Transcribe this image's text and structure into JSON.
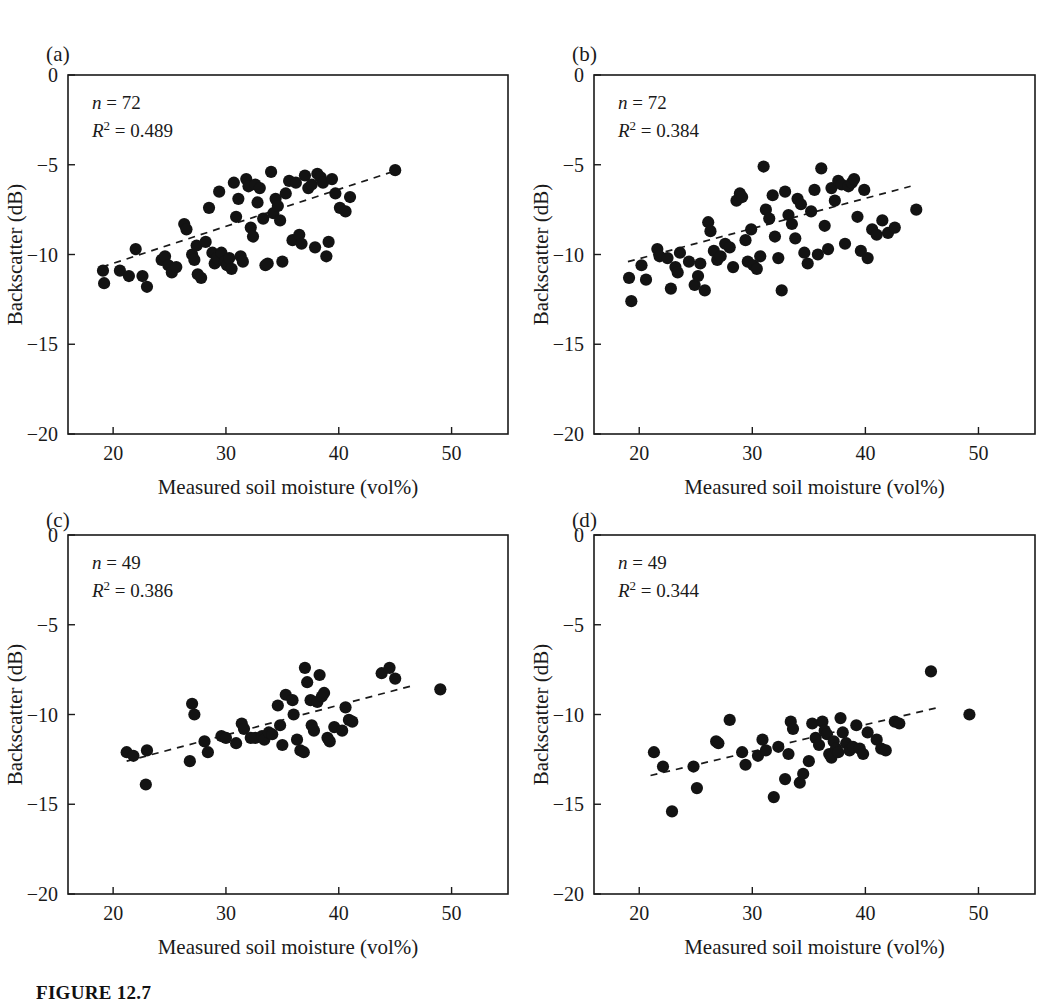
{
  "figure": {
    "caption": "FIGURE 12.7",
    "axis": {
      "xlabel": "Measured soil moisture (vol%)",
      "ylabel": "Backscatter (dB)",
      "xticks": [
        "20",
        "30",
        "40",
        "50"
      ],
      "yticks": [
        "0",
        "-5",
        "-10",
        "-15",
        "-20"
      ]
    }
  },
  "chart_data": [
    {
      "type": "scatter",
      "panel": "(a)",
      "title": "",
      "xlabel": "Measured soil moisture (vol%)",
      "ylabel": "Backscatter (dB)",
      "xlim": [
        16,
        55
      ],
      "ylim": [
        -20,
        0
      ],
      "xticks": [
        20,
        30,
        40,
        50
      ],
      "yticks": [
        0,
        -5,
        -10,
        -15,
        -20
      ],
      "grid": false,
      "legend": false,
      "annotations": {
        "n": "n = 72",
        "r2": "R2 = 0.489",
        "n_value": 72,
        "r2_value": 0.489
      },
      "trendline": {
        "style": "dashed",
        "x": [
          19.0,
          45.2
        ],
        "y": [
          -10.7,
          -5.3
        ]
      },
      "points": [
        [
          19.1,
          -10.9
        ],
        [
          19.2,
          -11.6
        ],
        [
          20.6,
          -10.9
        ],
        [
          21.4,
          -11.2
        ],
        [
          22.0,
          -9.7
        ],
        [
          22.6,
          -11.2
        ],
        [
          23.0,
          -11.8
        ],
        [
          24.3,
          -10.3
        ],
        [
          24.6,
          -10.1
        ],
        [
          24.9,
          -10.6
        ],
        [
          25.2,
          -11.0
        ],
        [
          25.6,
          -10.7
        ],
        [
          26.3,
          -8.3
        ],
        [
          26.5,
          -8.6
        ],
        [
          27.0,
          -10.0
        ],
        [
          27.2,
          -10.3
        ],
        [
          27.4,
          -9.5
        ],
        [
          27.5,
          -11.1
        ],
        [
          27.8,
          -11.3
        ],
        [
          28.2,
          -9.3
        ],
        [
          28.5,
          -7.4
        ],
        [
          28.8,
          -9.9
        ],
        [
          29.0,
          -10.5
        ],
        [
          29.2,
          -10.2
        ],
        [
          29.4,
          -6.5
        ],
        [
          29.6,
          -9.9
        ],
        [
          29.9,
          -10.4
        ],
        [
          30.1,
          -10.6
        ],
        [
          30.3,
          -10.2
        ],
        [
          30.5,
          -10.8
        ],
        [
          30.7,
          -6.0
        ],
        [
          30.9,
          -7.9
        ],
        [
          31.1,
          -6.9
        ],
        [
          31.3,
          -10.1
        ],
        [
          31.5,
          -10.4
        ],
        [
          31.8,
          -5.8
        ],
        [
          32.0,
          -6.2
        ],
        [
          32.2,
          -8.5
        ],
        [
          32.4,
          -9.0
        ],
        [
          32.6,
          -6.1
        ],
        [
          32.8,
          -7.1
        ],
        [
          33.0,
          -6.3
        ],
        [
          33.3,
          -8.0
        ],
        [
          33.5,
          -10.6
        ],
        [
          33.7,
          -10.5
        ],
        [
          34.0,
          -5.4
        ],
        [
          34.2,
          -7.7
        ],
        [
          34.4,
          -6.9
        ],
        [
          34.6,
          -7.3
        ],
        [
          34.8,
          -8.1
        ],
        [
          35.0,
          -10.4
        ],
        [
          35.3,
          -6.6
        ],
        [
          35.6,
          -5.9
        ],
        [
          35.9,
          -9.2
        ],
        [
          36.2,
          -6.0
        ],
        [
          36.5,
          -8.9
        ],
        [
          36.7,
          -9.4
        ],
        [
          37.0,
          -5.6
        ],
        [
          37.3,
          -6.3
        ],
        [
          37.6,
          -6.1
        ],
        [
          37.9,
          -9.6
        ],
        [
          38.1,
          -5.5
        ],
        [
          38.4,
          -5.7
        ],
        [
          38.6,
          -6.0
        ],
        [
          38.9,
          -10.1
        ],
        [
          39.1,
          -9.3
        ],
        [
          39.4,
          -5.8
        ],
        [
          39.7,
          -6.6
        ],
        [
          40.1,
          -7.4
        ],
        [
          40.6,
          -7.6
        ],
        [
          41.0,
          -6.8
        ],
        [
          45.0,
          -5.3
        ]
      ]
    },
    {
      "type": "scatter",
      "panel": "(b)",
      "title": "",
      "xlabel": "Measured soil moisture (vol%)",
      "ylabel": "Backscatter (dB)",
      "xlim": [
        16,
        55
      ],
      "ylim": [
        -20,
        0
      ],
      "xticks": [
        20,
        30,
        40,
        50
      ],
      "yticks": [
        0,
        -5,
        -10,
        -15,
        -20
      ],
      "grid": false,
      "legend": false,
      "annotations": {
        "n": "n = 72",
        "r2": "R2 = 0.384",
        "n_value": 72,
        "r2_value": 0.384
      },
      "trendline": {
        "style": "dashed",
        "x": [
          19.0,
          44.0
        ],
        "y": [
          -10.4,
          -6.2
        ]
      },
      "points": [
        [
          19.1,
          -11.3
        ],
        [
          19.3,
          -12.6
        ],
        [
          20.2,
          -10.6
        ],
        [
          20.6,
          -11.4
        ],
        [
          21.6,
          -9.7
        ],
        [
          21.8,
          -10.1
        ],
        [
          22.5,
          -10.2
        ],
        [
          22.8,
          -11.9
        ],
        [
          23.2,
          -10.7
        ],
        [
          23.4,
          -11.0
        ],
        [
          23.6,
          -9.9
        ],
        [
          24.4,
          -10.4
        ],
        [
          24.9,
          -11.7
        ],
        [
          25.2,
          -11.2
        ],
        [
          25.4,
          -10.5
        ],
        [
          25.8,
          -12.0
        ],
        [
          26.1,
          -8.2
        ],
        [
          26.3,
          -8.7
        ],
        [
          26.6,
          -9.8
        ],
        [
          26.9,
          -10.3
        ],
        [
          27.2,
          -10.1
        ],
        [
          27.6,
          -9.4
        ],
        [
          28.0,
          -9.6
        ],
        [
          28.3,
          -10.7
        ],
        [
          28.6,
          -7.0
        ],
        [
          28.9,
          -6.6
        ],
        [
          29.1,
          -6.8
        ],
        [
          29.4,
          -9.2
        ],
        [
          29.6,
          -10.4
        ],
        [
          29.9,
          -8.6
        ],
        [
          30.1,
          -10.6
        ],
        [
          30.4,
          -10.8
        ],
        [
          30.7,
          -10.1
        ],
        [
          31.0,
          -5.1
        ],
        [
          31.2,
          -7.5
        ],
        [
          31.5,
          -8.0
        ],
        [
          31.8,
          -6.7
        ],
        [
          32.0,
          -9.0
        ],
        [
          32.3,
          -10.2
        ],
        [
          32.6,
          -12.0
        ],
        [
          32.9,
          -6.5
        ],
        [
          33.2,
          -7.8
        ],
        [
          33.5,
          -8.3
        ],
        [
          33.8,
          -9.1
        ],
        [
          34.0,
          -6.9
        ],
        [
          34.3,
          -7.2
        ],
        [
          34.6,
          -9.9
        ],
        [
          34.9,
          -10.5
        ],
        [
          35.2,
          -7.6
        ],
        [
          35.5,
          -6.4
        ],
        [
          35.8,
          -10.0
        ],
        [
          36.1,
          -5.2
        ],
        [
          36.4,
          -8.4
        ],
        [
          36.7,
          -9.7
        ],
        [
          37.0,
          -6.3
        ],
        [
          37.3,
          -7.0
        ],
        [
          37.6,
          -5.9
        ],
        [
          37.9,
          -6.1
        ],
        [
          38.2,
          -9.4
        ],
        [
          38.5,
          -6.2
        ],
        [
          38.8,
          -6.0
        ],
        [
          39.0,
          -5.8
        ],
        [
          39.3,
          -7.9
        ],
        [
          39.6,
          -9.8
        ],
        [
          39.9,
          -6.4
        ],
        [
          40.2,
          -10.2
        ],
        [
          40.6,
          -8.6
        ],
        [
          41.0,
          -8.9
        ],
        [
          41.5,
          -8.1
        ],
        [
          42.0,
          -8.8
        ],
        [
          42.6,
          -8.5
        ],
        [
          44.5,
          -7.5
        ]
      ]
    },
    {
      "type": "scatter",
      "panel": "(c)",
      "title": "",
      "xlabel": "Measured soil moisture (vol%)",
      "ylabel": "Backscatter (dB)",
      "xlim": [
        16,
        55
      ],
      "ylim": [
        -20,
        0
      ],
      "xticks": [
        20,
        30,
        40,
        50
      ],
      "yticks": [
        0,
        -5,
        -10,
        -15,
        -20
      ],
      "grid": false,
      "legend": false,
      "annotations": {
        "n": "n = 49",
        "r2": "R2 = 0.386",
        "n_value": 49,
        "r2_value": 0.386
      },
      "trendline": {
        "style": "dashed",
        "x": [
          21.2,
          46.5
        ],
        "y": [
          -12.6,
          -8.4
        ]
      },
      "points": [
        [
          21.2,
          -12.1
        ],
        [
          21.8,
          -12.3
        ],
        [
          22.9,
          -13.9
        ],
        [
          23.0,
          -12.0
        ],
        [
          26.8,
          -12.6
        ],
        [
          27.0,
          -9.4
        ],
        [
          27.2,
          -10.0
        ],
        [
          28.1,
          -11.5
        ],
        [
          28.4,
          -12.1
        ],
        [
          29.6,
          -11.2
        ],
        [
          30.0,
          -11.3
        ],
        [
          30.9,
          -11.6
        ],
        [
          31.4,
          -10.5
        ],
        [
          31.6,
          -10.8
        ],
        [
          32.2,
          -11.3
        ],
        [
          32.6,
          -11.3
        ],
        [
          33.2,
          -11.2
        ],
        [
          33.4,
          -11.4
        ],
        [
          33.8,
          -11.0
        ],
        [
          34.1,
          -11.1
        ],
        [
          34.6,
          -9.5
        ],
        [
          34.8,
          -10.6
        ],
        [
          35.0,
          -11.7
        ],
        [
          35.3,
          -8.9
        ],
        [
          35.9,
          -9.2
        ],
        [
          36.0,
          -10.0
        ],
        [
          36.3,
          -11.4
        ],
        [
          36.6,
          -12.0
        ],
        [
          36.9,
          -12.1
        ],
        [
          37.0,
          -7.4
        ],
        [
          37.2,
          -8.2
        ],
        [
          37.5,
          -9.2
        ],
        [
          37.6,
          -10.6
        ],
        [
          37.8,
          -10.9
        ],
        [
          38.1,
          -9.3
        ],
        [
          38.3,
          -7.8
        ],
        [
          38.5,
          -9.0
        ],
        [
          38.7,
          -8.8
        ],
        [
          39.0,
          -11.3
        ],
        [
          39.2,
          -11.5
        ],
        [
          39.6,
          -10.7
        ],
        [
          40.3,
          -10.9
        ],
        [
          40.6,
          -9.6
        ],
        [
          40.9,
          -10.3
        ],
        [
          41.2,
          -10.4
        ],
        [
          43.8,
          -7.7
        ],
        [
          44.5,
          -7.4
        ],
        [
          45.0,
          -8.0
        ],
        [
          49.0,
          -8.6
        ]
      ]
    },
    {
      "type": "scatter",
      "panel": "(d)",
      "title": "",
      "xlabel": "Measured soil moisture (vol%)",
      "ylabel": "Backscatter (dB)",
      "xlim": [
        16,
        55
      ],
      "ylim": [
        -20,
        0
      ],
      "xticks": [
        20,
        30,
        40,
        50
      ],
      "yticks": [
        0,
        -5,
        -10,
        -15,
        -20
      ],
      "grid": false,
      "legend": false,
      "annotations": {
        "n": "n = 49",
        "r2": "R2 = 0.344",
        "n_value": 49,
        "r2_value": 0.344
      },
      "trendline": {
        "style": "dashed",
        "x": [
          21.0,
          46.5
        ],
        "y": [
          -13.4,
          -9.6
        ]
      },
      "points": [
        [
          21.3,
          -12.1
        ],
        [
          22.1,
          -12.9
        ],
        [
          22.9,
          -15.4
        ],
        [
          24.8,
          -12.9
        ],
        [
          25.1,
          -14.1
        ],
        [
          26.8,
          -11.5
        ],
        [
          27.0,
          -11.6
        ],
        [
          28.0,
          -10.3
        ],
        [
          29.1,
          -12.1
        ],
        [
          29.4,
          -12.8
        ],
        [
          30.5,
          -12.3
        ],
        [
          30.9,
          -11.4
        ],
        [
          31.2,
          -12.0
        ],
        [
          31.9,
          -14.6
        ],
        [
          32.3,
          -11.8
        ],
        [
          32.9,
          -13.6
        ],
        [
          33.2,
          -12.2
        ],
        [
          33.4,
          -10.4
        ],
        [
          33.6,
          -10.8
        ],
        [
          34.2,
          -13.8
        ],
        [
          34.5,
          -13.3
        ],
        [
          35.0,
          -12.6
        ],
        [
          35.3,
          -10.5
        ],
        [
          35.6,
          -11.3
        ],
        [
          35.9,
          -11.7
        ],
        [
          36.2,
          -10.4
        ],
        [
          36.4,
          -10.9
        ],
        [
          36.6,
          -11.1
        ],
        [
          36.8,
          -12.2
        ],
        [
          37.0,
          -12.4
        ],
        [
          37.2,
          -11.5
        ],
        [
          37.4,
          -11.9
        ],
        [
          37.6,
          -12.1
        ],
        [
          37.8,
          -10.2
        ],
        [
          38.0,
          -11.0
        ],
        [
          38.3,
          -11.6
        ],
        [
          38.6,
          -12.0
        ],
        [
          38.9,
          -11.8
        ],
        [
          39.2,
          -10.6
        ],
        [
          39.5,
          -11.9
        ],
        [
          39.8,
          -12.2
        ],
        [
          40.2,
          -11.0
        ],
        [
          41.0,
          -11.4
        ],
        [
          41.4,
          -11.9
        ],
        [
          41.8,
          -12.0
        ],
        [
          42.6,
          -10.4
        ],
        [
          43.0,
          -10.5
        ],
        [
          45.8,
          -7.6
        ],
        [
          49.2,
          -10.0
        ]
      ]
    }
  ]
}
